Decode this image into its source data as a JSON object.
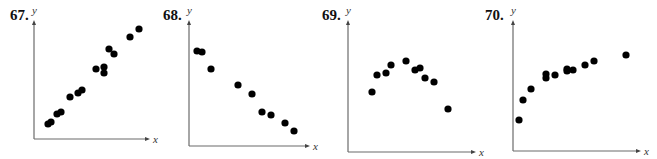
{
  "figure": {
    "background": "#ffffff",
    "point_color": "#000000",
    "axis_color": "#6b6b6b",
    "point_radius": 3.6
  },
  "panels": [
    {
      "number": "67.",
      "ylabel": "y",
      "xlabel": "x",
      "layout": {
        "label_x": 10,
        "label_y": 20,
        "origin_x": 34,
        "origin_y": 139,
        "y_top": 20,
        "x_right": 150
      },
      "points_px": [
        [
          48,
          124
        ],
        [
          51,
          122
        ],
        [
          57,
          114
        ],
        [
          61,
          112
        ],
        [
          70,
          97
        ],
        [
          78,
          93
        ],
        [
          82,
          90
        ],
        [
          96,
          69
        ],
        [
          104,
          67
        ],
        [
          104,
          73
        ],
        [
          109,
          49
        ],
        [
          114,
          54
        ],
        [
          130,
          37
        ],
        [
          139,
          29
        ]
      ]
    },
    {
      "number": "68.",
      "ylabel": "y",
      "xlabel": "x",
      "layout": {
        "label_x": 163,
        "label_y": 20,
        "origin_x": 189,
        "origin_y": 146,
        "y_top": 20,
        "x_right": 310
      },
      "points_px": [
        [
          197,
          51
        ],
        [
          202,
          52
        ],
        [
          211,
          69
        ],
        [
          238,
          85
        ],
        [
          252,
          94
        ],
        [
          262,
          112
        ],
        [
          271,
          115
        ],
        [
          285,
          123
        ],
        [
          294,
          131
        ]
      ]
    },
    {
      "number": "69.",
      "ylabel": "y",
      "xlabel": "x",
      "layout": {
        "label_x": 322,
        "label_y": 20,
        "origin_x": 348,
        "origin_y": 152,
        "y_top": 20,
        "x_right": 476
      },
      "points_px": [
        [
          372,
          92
        ],
        [
          377,
          75
        ],
        [
          386,
          73
        ],
        [
          391,
          65
        ],
        [
          406,
          61
        ],
        [
          415,
          70
        ],
        [
          420,
          68
        ],
        [
          425,
          78
        ],
        [
          434,
          82
        ],
        [
          448,
          109
        ]
      ]
    },
    {
      "number": "70.",
      "ylabel": "y",
      "xlabel": "x",
      "layout": {
        "label_x": 485,
        "label_y": 20,
        "origin_x": 513,
        "origin_y": 151,
        "y_top": 20,
        "x_right": 641
      },
      "points_px": [
        [
          519,
          120
        ],
        [
          523,
          100
        ],
        [
          531,
          89
        ],
        [
          546,
          74
        ],
        [
          546,
          78
        ],
        [
          555,
          75
        ],
        [
          567,
          69
        ],
        [
          567,
          71
        ],
        [
          573,
          70
        ],
        [
          585,
          65
        ],
        [
          594,
          61
        ],
        [
          626,
          55
        ]
      ]
    }
  ],
  "chart_data": [
    {
      "type": "scatter",
      "title": "67.",
      "xlabel": "x",
      "ylabel": "y",
      "grid": false,
      "ticks": "none",
      "trend": "strong positive linear",
      "x": [
        1.2,
        1.5,
        2.0,
        2.3,
        3.1,
        3.8,
        4.1,
        5.3,
        6.0,
        6.0,
        6.4,
        6.9,
        8.3,
        9.1
      ],
      "y": [
        1.3,
        1.5,
        2.1,
        2.3,
        3.6,
        3.9,
        4.2,
        6.0,
        6.2,
        5.7,
        7.6,
        7.2,
        8.6,
        9.3
      ]
    },
    {
      "type": "scatter",
      "title": "68.",
      "xlabel": "x",
      "ylabel": "y",
      "grid": false,
      "ticks": "none",
      "trend": "strong negative linear",
      "x": [
        0.7,
        1.1,
        1.8,
        4.0,
        5.2,
        6.0,
        6.8,
        7.9,
        8.7
      ],
      "y": [
        7.6,
        7.5,
        6.1,
        4.8,
        4.1,
        2.7,
        2.4,
        1.8,
        1.2
      ]
    },
    {
      "type": "scatter",
      "title": "69.",
      "xlabel": "x",
      "ylabel": "y",
      "grid": false,
      "ticks": "none",
      "trend": "quadratic (concave down)",
      "x": [
        1.9,
        2.3,
        3.0,
        3.4,
        4.5,
        5.2,
        5.6,
        6.0,
        6.7,
        7.8
      ],
      "y": [
        4.6,
        5.9,
        6.0,
        6.6,
        7.0,
        6.2,
        6.4,
        5.6,
        5.3,
        3.3
      ]
    },
    {
      "type": "scatter",
      "title": "70.",
      "xlabel": "x",
      "ylabel": "y",
      "grid": false,
      "ticks": "none",
      "trend": "logarithmic (increasing, concave down)",
      "x": [
        0.5,
        0.8,
        1.4,
        2.6,
        2.6,
        3.3,
        4.2,
        4.2,
        4.7,
        5.6,
        6.3,
        8.8
      ],
      "y": [
        2.3,
        3.9,
        4.7,
        5.9,
        5.6,
        5.8,
        6.3,
        6.1,
        6.2,
        6.6,
        6.9,
        7.4
      ]
    }
  ]
}
